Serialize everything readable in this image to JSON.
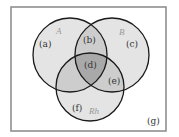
{
  "diagram": {
    "type": "venn-3",
    "colors": {
      "background": "#ffffff",
      "frame": "#888888",
      "circle_fill": "#e4e4e4",
      "overlap2_fill": "#c8c8c8",
      "overlap3_fill": "#a8a8a8",
      "outline": "#1a1a1a"
    },
    "sets": [
      {
        "name": "A"
      },
      {
        "name": "B"
      },
      {
        "name": "Rh"
      }
    ],
    "regions": [
      {
        "label": "(a)",
        "description": "A only"
      },
      {
        "label": "(b)",
        "description": "A and B, not Rh"
      },
      {
        "label": "(c)",
        "description": "B only"
      },
      {
        "label": "(d)",
        "description": "A and B and Rh"
      },
      {
        "label": "(e)",
        "description": "B and Rh, not A"
      },
      {
        "label": "(f)",
        "description": "Rh only"
      },
      {
        "label": "(g)",
        "description": "outside all sets"
      }
    ]
  }
}
